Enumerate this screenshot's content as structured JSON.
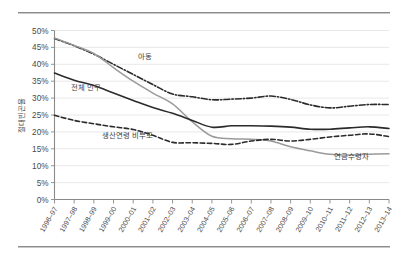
{
  "figure": {
    "background_color": "#ffffff",
    "rule_color": "#8c8c8c",
    "has_top_rule": true,
    "has_bottom_rule": true
  },
  "chart_data": {
    "type": "line",
    "title": "",
    "subtitle": "",
    "xlabel": "",
    "ylabel": "절대빈곤율",
    "ylim": [
      0,
      50
    ],
    "ytick_labels": [
      "0%",
      "5%",
      "10%",
      "15%",
      "20%",
      "25%",
      "30%",
      "35%",
      "40%",
      "45%",
      "50%"
    ],
    "ytick_values": [
      0,
      5,
      10,
      15,
      20,
      25,
      30,
      35,
      40,
      45,
      50
    ],
    "grid": true,
    "grid_axis": "y",
    "legend_position": "inline-annotations",
    "categories": [
      "1996–97",
      "1997–98",
      "1998–99",
      "1999–00",
      "2000–01",
      "2001–02",
      "2002–03",
      "2003–04",
      "2004–05",
      "2005–06",
      "2006–07",
      "2007–08",
      "2008–09",
      "2009–10",
      "2010–11",
      "2011–12",
      "2012–13",
      "2013–14"
    ],
    "series": [
      {
        "name": "아동",
        "label": "아동",
        "style": "dash-dot",
        "color": "#2b2b2b",
        "width": 1.6,
        "values": [
          47.6,
          45.5,
          43.0,
          40.0,
          37.0,
          34.0,
          31.2,
          30.4,
          29.5,
          29.7,
          30.0,
          30.6,
          29.6,
          28.0,
          27.1,
          27.6,
          28.1,
          28.1
        ]
      },
      {
        "name": "연금수령자",
        "label": "연금수령자",
        "style": "solid",
        "color": "#9a9a9a",
        "width": 1.5,
        "values": [
          47.8,
          45.6,
          43.2,
          39.0,
          35.0,
          31.5,
          28.3,
          23.0,
          18.7,
          18.0,
          17.8,
          17.3,
          15.6,
          14.4,
          13.4,
          13.2,
          13.4,
          13.5
        ]
      },
      {
        "name": "전체 인구",
        "label": "전체 인구",
        "style": "solid",
        "color": "#2b2b2b",
        "width": 1.6,
        "values": [
          37.4,
          35.3,
          33.7,
          31.5,
          29.3,
          27.2,
          25.5,
          23.4,
          21.4,
          21.8,
          21.8,
          21.7,
          21.4,
          20.8,
          20.8,
          21.2,
          21.5,
          21.0
        ]
      },
      {
        "name": "생산연령 비부모",
        "label": "생산연령 비부모",
        "style": "dashed",
        "color": "#2b2b2b",
        "width": 1.6,
        "values": [
          24.9,
          23.4,
          22.4,
          21.5,
          20.7,
          19.0,
          16.9,
          16.8,
          16.6,
          16.3,
          17.3,
          17.8,
          17.3,
          17.8,
          18.5,
          19.0,
          19.4,
          18.6
        ]
      }
    ],
    "annotations": [
      {
        "text": "아동",
        "series": "아동",
        "x_index": 4.6,
        "value": 41.5
      },
      {
        "text": "전체 인구",
        "series": "전체 인구",
        "x_index": 1.6,
        "value": 32.3
      },
      {
        "text": "생산연령 비부모",
        "series": "생산연령 비부모",
        "x_index": 3.7,
        "value": 18.3
      },
      {
        "text": "연금수령자",
        "series": "연금수령자",
        "x_index": 15.1,
        "value": 12.0
      }
    ]
  }
}
